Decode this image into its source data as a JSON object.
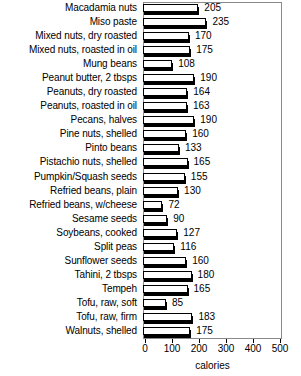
{
  "chart_data": {
    "type": "bar",
    "orientation": "horizontal",
    "title": "",
    "xlabel": "calories",
    "ylabel": "",
    "xlim": [
      0,
      500
    ],
    "xticks": [
      0,
      100,
      200,
      300,
      400,
      500
    ],
    "xtick_labels": [
      "0",
      "100",
      "200",
      "300",
      "400",
      "500"
    ],
    "grid": false,
    "legend": false,
    "categories": [
      "Macadamia nuts",
      "Miso paste",
      "Mixed nuts, dry roasted",
      "Mixed nuts, roasted in oil",
      "Mung beans",
      "Peanut butter, 2 tbsps",
      "Peanuts, dry roasted",
      "Peanuts, roasted in oil",
      "Pecans, halves",
      "Pine nuts, shelled",
      "Pinto beans",
      "Pistachio nuts, shelled",
      "Pumpkin/Squash seeds",
      "Refried beans, plain",
      "Refried beans, w/cheese",
      "Sesame seeds",
      "Soybeans, cooked",
      "Split peas",
      "Sunflower seeds",
      "Tahini, 2 tbsps",
      "Tempeh",
      "Tofu, raw, soft",
      "Tofu, raw, firm",
      "Walnuts, shelled"
    ],
    "values": [
      205,
      235,
      170,
      175,
      108,
      190,
      164,
      163,
      190,
      160,
      133,
      165,
      155,
      130,
      72,
      90,
      127,
      116,
      160,
      180,
      165,
      85,
      183,
      175
    ],
    "value_labels": [
      "205",
      "235",
      "170",
      "175",
      "108",
      "190",
      "164",
      "163",
      "190",
      "160",
      "133",
      "165",
      "155",
      "130",
      "72",
      "90",
      "127",
      "116",
      "160",
      "180",
      "165",
      "85",
      "183",
      "175"
    ],
    "colors": {
      "bar_face": "#ffffff",
      "bar_outline": "#000000",
      "bar_shadow": "#000000",
      "axis": "#000000",
      "frame": "#8a8a8a",
      "text": "#000000",
      "background": "#ffffff"
    }
  }
}
